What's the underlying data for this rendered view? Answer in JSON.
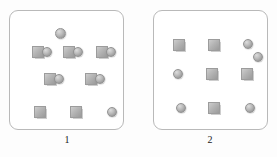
{
  "figure": {
    "background_color": "#fdfdfd",
    "shape_fill_color": "#b4b4b4",
    "border_color": "#b9b9b9",
    "panel_count": 2
  },
  "panels": [
    {
      "label": "1",
      "name": "panel-1",
      "x": 9,
      "y": 10,
      "width": 115,
      "height": 120,
      "label_x": 57,
      "label_y": 134,
      "shapes": [
        {
          "type": "circle",
          "x": 45,
          "y": 17,
          "size": 11,
          "name": "circle-top-center"
        },
        {
          "type": "square",
          "x": 22,
          "y": 35,
          "size": 12,
          "name": "square-r1-c1"
        },
        {
          "type": "circle",
          "x": 32,
          "y": 36,
          "size": 10,
          "name": "circle-r1-c1"
        },
        {
          "type": "square",
          "x": 53,
          "y": 35,
          "size": 12,
          "name": "square-r1-c2"
        },
        {
          "type": "circle",
          "x": 63,
          "y": 36,
          "size": 10,
          "name": "circle-r1-c2"
        },
        {
          "type": "square",
          "x": 86,
          "y": 35,
          "size": 12,
          "name": "square-r1-c3"
        },
        {
          "type": "circle",
          "x": 96,
          "y": 36,
          "size": 10,
          "name": "circle-r1-c3"
        },
        {
          "type": "square",
          "x": 34,
          "y": 62,
          "size": 12,
          "name": "square-r2-c1"
        },
        {
          "type": "circle",
          "x": 44,
          "y": 63,
          "size": 10,
          "name": "circle-r2-c1"
        },
        {
          "type": "square",
          "x": 75,
          "y": 62,
          "size": 12,
          "name": "square-r2-c2"
        },
        {
          "type": "circle",
          "x": 85,
          "y": 63,
          "size": 10,
          "name": "circle-r2-c2"
        },
        {
          "type": "square",
          "x": 24,
          "y": 95,
          "size": 12,
          "name": "square-r3-c1"
        },
        {
          "type": "square",
          "x": 60,
          "y": 95,
          "size": 12,
          "name": "square-r3-c2"
        },
        {
          "type": "circle",
          "x": 97,
          "y": 96,
          "size": 10,
          "name": "circle-r3-c3"
        }
      ]
    },
    {
      "label": "2",
      "name": "panel-2",
      "x": 153,
      "y": 10,
      "width": 115,
      "height": 120,
      "label_x": 200,
      "label_y": 134,
      "shapes": [
        {
          "type": "square",
          "x": 19,
          "y": 28,
          "size": 12,
          "name": "square-r1-c1"
        },
        {
          "type": "square",
          "x": 54,
          "y": 28,
          "size": 12,
          "name": "square-r1-c2"
        },
        {
          "type": "circle",
          "x": 89,
          "y": 28,
          "size": 10,
          "name": "circle-r1-c3"
        },
        {
          "type": "circle",
          "x": 99,
          "y": 41,
          "size": 10,
          "name": "circle-r1-c3-offset"
        },
        {
          "type": "circle",
          "x": 19,
          "y": 58,
          "size": 10,
          "name": "circle-r2-c1"
        },
        {
          "type": "square",
          "x": 52,
          "y": 57,
          "size": 12,
          "name": "square-r2-c2"
        },
        {
          "type": "square",
          "x": 87,
          "y": 57,
          "size": 12,
          "name": "square-r2-c3"
        },
        {
          "type": "circle",
          "x": 22,
          "y": 92,
          "size": 10,
          "name": "circle-r3-c1"
        },
        {
          "type": "square",
          "x": 54,
          "y": 91,
          "size": 12,
          "name": "square-r3-c2"
        },
        {
          "type": "circle",
          "x": 91,
          "y": 92,
          "size": 10,
          "name": "circle-r3-c3"
        }
      ]
    }
  ]
}
